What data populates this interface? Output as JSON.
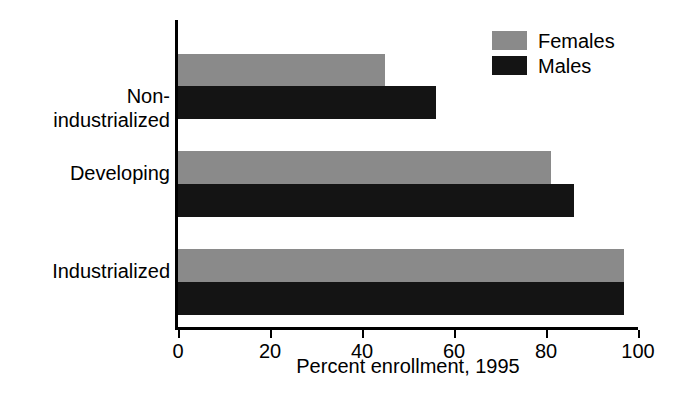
{
  "chart_data": {
    "type": "bar",
    "orientation": "horizontal",
    "title": "",
    "xlabel": "Percent enrollment, 1995",
    "ylabel": "",
    "xlim": [
      0,
      100
    ],
    "xticks": [
      0,
      20,
      40,
      60,
      80,
      100
    ],
    "xtick_labels": [
      "0",
      "20",
      "40",
      "60",
      "80",
      "100"
    ],
    "grid": false,
    "legend_position": "top-right",
    "categories": [
      "Industrialized",
      "Developing",
      "Non-industrialized"
    ],
    "category_labels_display": [
      [
        "Industrialized"
      ],
      [
        "Developing"
      ],
      [
        "Non-",
        "industrialized"
      ]
    ],
    "series": [
      {
        "name": "Females",
        "color": "#8a8a8a",
        "values": [
          97,
          81,
          45
        ]
      },
      {
        "name": "Males",
        "color": "#141414",
        "values": [
          97,
          86,
          56
        ]
      }
    ]
  },
  "legend": {
    "items": [
      {
        "label": "Females",
        "color": "#8a8a8a"
      },
      {
        "label": "Males",
        "color": "#141414"
      }
    ]
  },
  "axis": {
    "x_title": "Percent enrollment, 1995",
    "tick_labels": [
      "0",
      "20",
      "40",
      "60",
      "80",
      "100"
    ]
  },
  "colors": {
    "female": "#8a8a8a",
    "male": "#141414",
    "axis": "#000000",
    "background": "#ffffff"
  }
}
